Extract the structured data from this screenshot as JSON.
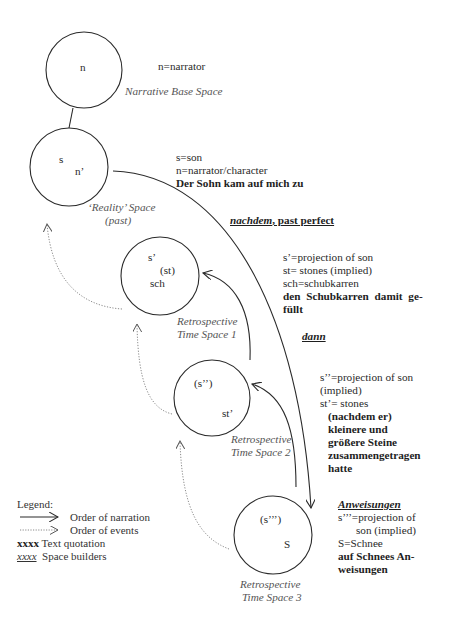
{
  "spaces": [
    {
      "id": "narrative-base",
      "name": "Narrative Base Space",
      "labels": [
        "n"
      ],
      "key": [
        "n=narrator"
      ],
      "quote": []
    },
    {
      "id": "reality",
      "name_line1": "‘Reality’ Space",
      "name_line2": "(past)",
      "labels": [
        "s",
        "n’"
      ],
      "key": [
        "s=son",
        "n=narrator/character"
      ],
      "quote": [
        "Der Sohn kam auf mich zu"
      ],
      "space_builder": "nachdem",
      "space_builder_suffix": ", past perfect"
    },
    {
      "id": "retro-1",
      "name_line1": "Retrospective",
      "name_line2": "Time Space 1",
      "labels": [
        "s’",
        "(st)",
        "sch"
      ],
      "key": [
        "s’=projection of son",
        "st= stones (implied)",
        "sch=schubkarren"
      ],
      "quote": [
        "den Schubkarren damit ge-",
        "füllt"
      ],
      "space_builder": "dann"
    },
    {
      "id": "retro-2",
      "name_line1": "Retrospective",
      "name_line2": "Time Space 2",
      "labels": [
        "(s’’)",
        "st’"
      ],
      "key": [
        "s’’=projection of son",
        "(implied)",
        "st’= stones"
      ],
      "quote": [
        "(nachdem er)",
        "kleinere und",
        "größere Steine",
        "zusammengetragen",
        "hatte"
      ]
    },
    {
      "id": "retro-3",
      "name_line1": "Retrospective",
      "name_line2": "Time Space 3",
      "labels": [
        "(s’’’)",
        "S"
      ],
      "space_builder": "Anweisungen",
      "key": [
        "s’’’=projection of",
        "son (implied)",
        "S=Schnee"
      ],
      "quote": [
        "auf Schnees An-",
        "weisungen"
      ]
    }
  ],
  "legend": {
    "title": "Legend:",
    "narration": "Order of narration",
    "events": "Order of events",
    "quote_sample": "xxxx",
    "quote_label": "Text quotation",
    "builder_sample": "xxxx",
    "builder_label": "Space builders"
  },
  "colors": {
    "line": "#2a2a2a",
    "dotted": "#8a8a8a",
    "italic_label": "#555555"
  }
}
